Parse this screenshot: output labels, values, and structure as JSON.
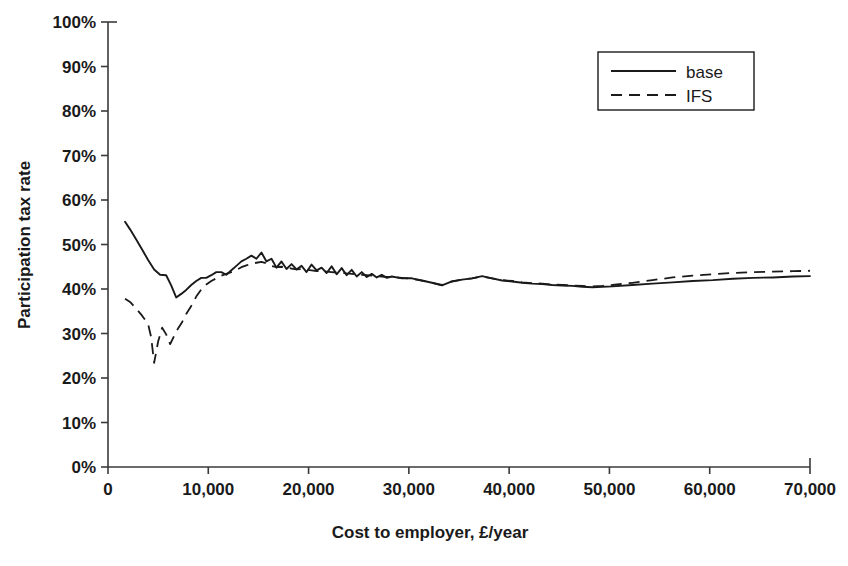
{
  "chart_data": {
    "type": "line",
    "title": "",
    "xlabel": "Cost to employer, £/year",
    "ylabel": "Participation tax rate",
    "xlim": [
      0,
      70000
    ],
    "ylim": [
      0,
      1.0
    ],
    "grid": false,
    "legend_position": "top-right",
    "xticks": [
      0,
      10000,
      20000,
      30000,
      40000,
      50000,
      60000,
      70000
    ],
    "xtick_labels": [
      "0",
      "10,000",
      "20,000",
      "30,000",
      "40,000",
      "50,000",
      "60,000",
      "70,000"
    ],
    "yticks": [
      0,
      0.1,
      0.2,
      0.3,
      0.4,
      0.5,
      0.6,
      0.7,
      0.8,
      0.9,
      1.0
    ],
    "ytick_labels": [
      "0%",
      "10%",
      "20%",
      "30%",
      "40%",
      "50%",
      "60%",
      "70%",
      "80%",
      "90%",
      "100%"
    ],
    "line_color": "#1a1a1a",
    "series": [
      {
        "name": "base",
        "style": "solid",
        "x": [
          1700,
          2200,
          2800,
          3400,
          4000,
          4600,
          5200,
          5800,
          6300,
          6800,
          7300,
          7800,
          8300,
          8800,
          9300,
          9800,
          10300,
          10800,
          11300,
          11800,
          12300,
          12800,
          13300,
          13800,
          14300,
          14800,
          15300,
          15800,
          16300,
          16800,
          17300,
          17800,
          18300,
          18800,
          19300,
          19800,
          20300,
          20800,
          21300,
          21800,
          22300,
          22800,
          23300,
          23800,
          24300,
          24800,
          25300,
          25800,
          26300,
          26800,
          27300,
          27800,
          28300,
          29300,
          30300,
          31300,
          32300,
          33300,
          34300,
          35300,
          36300,
          37300,
          38300,
          39300,
          40300,
          41300,
          42300,
          43300,
          44300,
          45300,
          46300,
          47300,
          48300,
          49300,
          50300,
          52300,
          54300,
          56300,
          58300,
          60300,
          62300,
          64300,
          66300,
          68300,
          70000
        ],
        "y": [
          0.551,
          0.534,
          0.512,
          0.489,
          0.465,
          0.444,
          0.432,
          0.431,
          0.408,
          0.381,
          0.389,
          0.398,
          0.409,
          0.418,
          0.425,
          0.425,
          0.431,
          0.438,
          0.438,
          0.432,
          0.442,
          0.452,
          0.462,
          0.468,
          0.475,
          0.468,
          0.482,
          0.462,
          0.468,
          0.448,
          0.462,
          0.445,
          0.456,
          0.444,
          0.452,
          0.438,
          0.455,
          0.442,
          0.448,
          0.436,
          0.451,
          0.433,
          0.447,
          0.431,
          0.443,
          0.428,
          0.438,
          0.427,
          0.434,
          0.426,
          0.432,
          0.425,
          0.428,
          0.424,
          0.424,
          0.419,
          0.414,
          0.408,
          0.417,
          0.421,
          0.424,
          0.429,
          0.424,
          0.419,
          0.417,
          0.414,
          0.412,
          0.411,
          0.409,
          0.408,
          0.407,
          0.405,
          0.404,
          0.405,
          0.406,
          0.409,
          0.412,
          0.415,
          0.418,
          0.42,
          0.423,
          0.425,
          0.426,
          0.428,
          0.429
        ]
      },
      {
        "name": "IFS",
        "style": "dashed",
        "x": [
          1700,
          2200,
          2800,
          3400,
          4000,
          4300,
          4600,
          5000,
          5400,
          5800,
          6200,
          6600,
          7000,
          7400,
          7800,
          8300,
          8800,
          9300,
          9800,
          10300,
          10800,
          11300,
          11800,
          12300,
          12800,
          13300,
          13800,
          14300,
          14800,
          15300,
          15800,
          16300,
          16800,
          17300,
          17800,
          18300,
          18800,
          19300,
          19800,
          20300,
          20800,
          21300,
          21800,
          22300,
          22800,
          23300,
          23800,
          24300,
          24800,
          25300,
          25800,
          26300,
          26800,
          27300,
          27800,
          28300,
          29300,
          30300,
          31300,
          32300,
          33300,
          34300,
          35300,
          36300,
          37300,
          38300,
          39300,
          40300,
          41300,
          42300,
          43300,
          44300,
          45300,
          46300,
          47300,
          48300,
          49300,
          50300,
          52300,
          54300,
          56300,
          58300,
          60300,
          62300,
          64300,
          66300,
          68300,
          70000
        ],
        "y": [
          0.378,
          0.371,
          0.356,
          0.34,
          0.321,
          0.292,
          0.234,
          0.282,
          0.313,
          0.298,
          0.276,
          0.295,
          0.312,
          0.326,
          0.344,
          0.362,
          0.383,
          0.399,
          0.41,
          0.418,
          0.424,
          0.43,
          0.434,
          0.438,
          0.443,
          0.449,
          0.453,
          0.457,
          0.459,
          0.461,
          0.458,
          0.452,
          0.449,
          0.45,
          0.448,
          0.446,
          0.444,
          0.445,
          0.443,
          0.442,
          0.44,
          0.441,
          0.439,
          0.438,
          0.437,
          0.437,
          0.435,
          0.434,
          0.433,
          0.432,
          0.431,
          0.43,
          0.429,
          0.428,
          0.427,
          0.427,
          0.425,
          0.423,
          0.419,
          0.414,
          0.409,
          0.417,
          0.421,
          0.424,
          0.428,
          0.424,
          0.42,
          0.418,
          0.415,
          0.413,
          0.412,
          0.41,
          0.409,
          0.408,
          0.407,
          0.406,
          0.407,
          0.409,
          0.414,
          0.42,
          0.426,
          0.43,
          0.433,
          0.436,
          0.438,
          0.439,
          0.44,
          0.441
        ]
      }
    ],
    "legend": [
      {
        "label": "base",
        "style": "solid"
      },
      {
        "label": "IFS",
        "style": "dashed"
      }
    ]
  }
}
